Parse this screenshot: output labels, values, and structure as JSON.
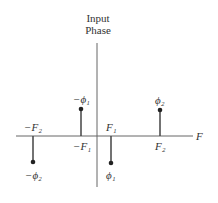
{
  "title": {
    "line1": "Input",
    "line2": "Phase"
  },
  "axis": {
    "x_label": "F"
  },
  "stems": [
    {
      "freq_label": "−F₂",
      "phase_label": "−ϕ₂",
      "x": 33,
      "y": 162
    },
    {
      "freq_label": "−F₁",
      "phase_label": "−ϕ₁",
      "x": 81,
      "y": 109
    },
    {
      "freq_label": "F₁",
      "phase_label": "ϕ₁",
      "x": 111,
      "y": 163
    },
    {
      "freq_label": "F₂",
      "phase_label": "ϕ₂",
      "x": 160,
      "y": 110
    }
  ],
  "colors": {
    "line": "#555555",
    "dot": "#222222"
  }
}
